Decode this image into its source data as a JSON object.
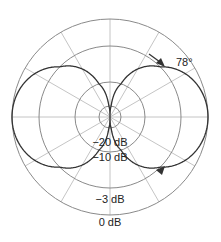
{
  "chart_data": {
    "type": "polar",
    "title": "",
    "pattern": "figure-8 (bidirectional) polar pickup pattern",
    "center": {
      "x": 110,
      "y": 117
    },
    "rings": [
      {
        "label": "0 dB",
        "db": 0,
        "radius": 98
      },
      {
        "label": "-3 dB",
        "db": -3,
        "radius": 71
      },
      {
        "label": "-10 dB",
        "db": -10,
        "radius": 35
      },
      {
        "label": "-20 dB",
        "db": -20,
        "radius": 11
      }
    ],
    "spokes_deg": [
      0,
      30,
      60,
      90,
      120,
      150,
      180,
      210,
      240,
      270,
      300,
      330
    ],
    "series": [
      {
        "name": "figure-8 response",
        "formula": "r = |cos(theta)|",
        "lobes": [
          "front (right)",
          "rear (left)"
        ]
      }
    ],
    "annotations": [
      {
        "text": "78°",
        "x": 176,
        "y": 66
      }
    ],
    "arrows": [
      {
        "x": 165,
        "y": 67,
        "direction": "down-right"
      },
      {
        "x": 165,
        "y": 166,
        "direction": "up-right"
      }
    ],
    "colors": {
      "grid": "#b5b5b5",
      "rings": "#8a8a8a",
      "curve": "#333333",
      "text": "#222222"
    }
  },
  "labels": {
    "ring_m20": "−20 dB",
    "ring_m10": "−10 dB",
    "ring_m3": "−3 dB",
    "ring_0": "0 dB",
    "angle": "78°"
  }
}
